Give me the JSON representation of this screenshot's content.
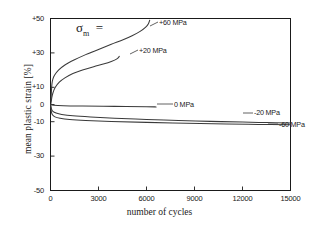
{
  "chart_data": {
    "type": "line",
    "title": "",
    "xlabel": "number of cycles",
    "ylabel": "mean plastic strain [%]",
    "xlim": [
      0,
      15000
    ],
    "ylim": [
      -50,
      50
    ],
    "xticks": [
      "0",
      "3000",
      "6000",
      "9000",
      "12000",
      "15000"
    ],
    "xtick_values": [
      0,
      3000,
      6000,
      9000,
      12000,
      15000
    ],
    "yticks": [
      "+50",
      "+30",
      "+10",
      "0",
      "-10",
      "-30",
      "-50"
    ],
    "ytick_values": [
      50,
      30,
      10,
      0,
      -10,
      -30,
      -50
    ],
    "grid": false,
    "legend_position": "inline-annotations",
    "legend_title": "σm =",
    "series": [
      {
        "name": "+60 MPa",
        "label": "+60 MPa",
        "color": "#3a3a3a",
        "points": [
          [
            30,
            2
          ],
          [
            60,
            8
          ],
          [
            90,
            12
          ],
          [
            140,
            14.5
          ],
          [
            250,
            17
          ],
          [
            500,
            20
          ],
          [
            900,
            23
          ],
          [
            1500,
            26
          ],
          [
            2200,
            29
          ],
          [
            3000,
            32
          ],
          [
            3800,
            35
          ],
          [
            4500,
            37.5
          ],
          [
            5100,
            40
          ],
          [
            5600,
            42.5
          ],
          [
            5950,
            45
          ],
          [
            6120,
            47
          ],
          [
            6200,
            49
          ]
        ]
      },
      {
        "name": "+20 MPa",
        "label": "+20 MPa",
        "color": "#3a3a3a",
        "points": [
          [
            30,
            0.5
          ],
          [
            80,
            4
          ],
          [
            160,
            7
          ],
          [
            300,
            10
          ],
          [
            550,
            13
          ],
          [
            900,
            15.5
          ],
          [
            1400,
            18
          ],
          [
            2000,
            20
          ],
          [
            2700,
            22
          ],
          [
            3300,
            23.5
          ],
          [
            3800,
            25
          ],
          [
            4150,
            26.5
          ],
          [
            4300,
            28
          ]
        ]
      },
      {
        "name": "0 MPa",
        "label": "0 MPa",
        "color": "#3a3a3a",
        "points": [
          [
            0,
            0
          ],
          [
            200,
            -0.4
          ],
          [
            800,
            -0.7
          ],
          [
            2000,
            -0.9
          ],
          [
            4000,
            -1.1
          ],
          [
            6000,
            -1.3
          ],
          [
            6600,
            -1.4
          ]
        ]
      },
      {
        "name": "-20 MPa",
        "label": "-20 MPa",
        "color": "#3a3a3a",
        "points": [
          [
            0,
            0
          ],
          [
            60,
            -2.5
          ],
          [
            150,
            -4
          ],
          [
            350,
            -5
          ],
          [
            700,
            -5.8
          ],
          [
            1400,
            -6.6
          ],
          [
            2500,
            -7.3
          ],
          [
            4000,
            -8
          ],
          [
            6000,
            -8.7
          ],
          [
            8000,
            -9.3
          ],
          [
            10000,
            -9.8
          ],
          [
            12000,
            -10.2
          ],
          [
            13500,
            -10.5
          ],
          [
            15000,
            -10.7
          ]
        ]
      },
      {
        "name": "-60 MPa",
        "label": "-60 MPa",
        "color": "#3a3a3a",
        "points": [
          [
            0,
            0
          ],
          [
            50,
            -4
          ],
          [
            120,
            -6
          ],
          [
            280,
            -7.2
          ],
          [
            600,
            -8
          ],
          [
            1200,
            -8.7
          ],
          [
            2200,
            -9.3
          ],
          [
            3800,
            -9.9
          ],
          [
            6000,
            -10.4
          ],
          [
            8500,
            -10.9
          ],
          [
            11000,
            -11.3
          ],
          [
            13000,
            -11.6
          ],
          [
            15000,
            -11.8
          ]
        ]
      }
    ],
    "annotations": [
      {
        "name": "sigma-m-legend-title",
        "text": "σ",
        "sub": "m",
        "eq": "="
      },
      {
        "name": "label-plus-60",
        "text": "+60 MPa"
      },
      {
        "name": "label-plus-20",
        "text": "+20 MPa"
      },
      {
        "name": "label-zero",
        "text": "0 MPa"
      },
      {
        "name": "label-minus-20",
        "text": "-20 MPa"
      },
      {
        "name": "label-minus-60",
        "text": "-60 MPa"
      }
    ]
  },
  "axis": {
    "frame_color": "#1a1a1a",
    "background": "#ffffff"
  }
}
